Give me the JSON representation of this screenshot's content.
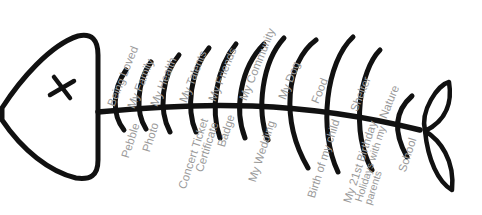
{
  "diagram": {
    "type": "fishbone",
    "colors": {
      "bones": "#111111",
      "text": "#9a9a9a",
      "background": "#ffffff"
    },
    "upper_labels": [
      "Being Loved",
      "My Family",
      "My Health",
      "My Talents",
      "My Friends",
      "My Community",
      "My Dog",
      "Food",
      "Shelter",
      "Nature"
    ],
    "lower_labels": [
      "Pebble",
      "Photo",
      "Concert Ticket",
      "Certificate",
      "Badge",
      "My Wedding",
      "Birth of my child",
      "My 21st Birthday",
      "Holidays with my parents",
      "School"
    ],
    "icons": [
      "fish-head-icon",
      "fish-eye-x-icon",
      "fish-tail-icon"
    ]
  }
}
